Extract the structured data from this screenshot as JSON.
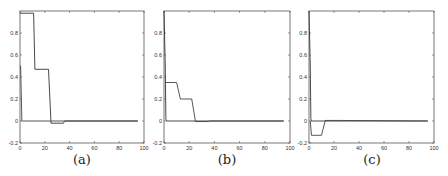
{
  "chart_data": [
    {
      "type": "line",
      "caption": "(a)",
      "title": "",
      "xlabel": "",
      "ylabel": "",
      "xlim": [
        0,
        100
      ],
      "ylim": [
        -0.2,
        1.0
      ],
      "xticks": [
        0,
        20,
        40,
        60,
        80,
        100
      ],
      "yticks": [
        -0.2,
        0,
        0.2,
        0.4,
        0.6,
        0.8
      ],
      "ytick_labels": [
        "-0.2",
        "0",
        "0.2",
        "0.4",
        "0.6",
        "0.8"
      ],
      "grid": false,
      "series": [
        {
          "name": "series-1",
          "x": [
            0,
            11,
            12,
            22,
            23,
            25,
            35,
            36,
            95
          ],
          "y": [
            0.98,
            0.98,
            0.47,
            0.47,
            0.47,
            -0.02,
            -0.02,
            0,
            0
          ]
        },
        {
          "name": "series-2",
          "x": [
            0,
            0.5,
            1.5,
            2,
            95
          ],
          "y": [
            0.5,
            0.5,
            0,
            0,
            0
          ]
        }
      ]
    },
    {
      "type": "line",
      "caption": "(b)",
      "title": "",
      "xlabel": "",
      "ylabel": "",
      "xlim": [
        0,
        100
      ],
      "ylim": [
        -0.2,
        1.0
      ],
      "xticks": [
        0,
        20,
        40,
        60,
        80,
        100
      ],
      "yticks": [
        -0.2,
        0,
        0.2,
        0.4,
        0.6,
        0.8
      ],
      "ytick_labels": [
        "-0.2",
        "0",
        "0.2",
        "0.4",
        "0.6",
        "0.8"
      ],
      "grid": false,
      "series": [
        {
          "name": "series-1",
          "x": [
            0,
            1,
            1.5,
            2,
            95
          ],
          "y": [
            1.0,
            0.5,
            0.02,
            0,
            0
          ]
        },
        {
          "name": "series-2",
          "x": [
            1,
            10,
            13,
            22,
            25,
            35,
            36,
            95
          ],
          "y": [
            0.35,
            0.35,
            0.2,
            0.2,
            -0.005,
            -0.005,
            0,
            0
          ]
        }
      ]
    },
    {
      "type": "line",
      "caption": "(c)",
      "title": "",
      "xlabel": "",
      "ylabel": "",
      "xlim": [
        0,
        100
      ],
      "ylim": [
        -0.2,
        1.0
      ],
      "xticks": [
        0,
        20,
        40,
        60,
        80,
        100
      ],
      "yticks": [
        -0.2,
        0,
        0.2,
        0.4,
        0.6,
        0.8
      ],
      "ytick_labels": [
        "-0.2",
        "0",
        "0.2",
        "0.4",
        "0.6",
        "0.8"
      ],
      "grid": false,
      "series": [
        {
          "name": "series-1",
          "x": [
            0,
            1,
            1.5,
            2,
            95
          ],
          "y": [
            1.0,
            0.5,
            0.02,
            0,
            0
          ]
        },
        {
          "name": "series-2",
          "x": [
            1,
            2,
            10,
            13,
            25,
            95
          ],
          "y": [
            0,
            -0.13,
            -0.13,
            0.005,
            0.005,
            0
          ]
        }
      ]
    }
  ],
  "panels": [
    {
      "caption": "(a)"
    },
    {
      "caption": "(b)"
    },
    {
      "caption": "(c)"
    }
  ]
}
